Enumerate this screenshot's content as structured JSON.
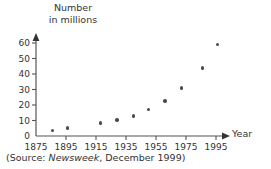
{
  "chart_data": {
    "type": "scatter",
    "title": "",
    "ylabel": "Number\nin millions",
    "xlabel": "Year",
    "xlim": [
      1875,
      1999
    ],
    "ylim": [
      0,
      64
    ],
    "xticks": [
      1875,
      1895,
      1915,
      1935,
      1955,
      1975,
      1995
    ],
    "yticks": [
      0,
      10,
      20,
      30,
      40,
      50,
      60
    ],
    "grid": false,
    "legend": null,
    "x": [
      1886,
      1896,
      1918,
      1929,
      1940,
      1950,
      1961,
      1972,
      1986,
      1996
    ],
    "values": [
      3.5,
      5,
      8.5,
      10.5,
      13,
      17,
      22.5,
      31,
      44,
      59
    ],
    "points": [
      {
        "x": 1886,
        "y": 3.5
      },
      {
        "x": 1896,
        "y": 5
      },
      {
        "x": 1918,
        "y": 8.5
      },
      {
        "x": 1929,
        "y": 10.5
      },
      {
        "x": 1940,
        "y": 13
      },
      {
        "x": 1950,
        "y": 17
      },
      {
        "x": 1961,
        "y": 22.5
      },
      {
        "x": 1972,
        "y": 31
      },
      {
        "x": 1986,
        "y": 44
      },
      {
        "x": 1996,
        "y": 59
      }
    ],
    "marker_color": "#4a4a4a",
    "axis_color": "#555555"
  },
  "caption": {
    "prefix": "(Source: ",
    "publication": "Newsweek",
    "suffix": ", December 1999)"
  }
}
